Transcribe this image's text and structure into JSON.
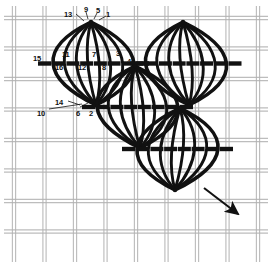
{
  "figure": {
    "type": "needlework-stitch-diagram",
    "ink_color": "#111111",
    "canvas_thread_color": "#b2b2b2",
    "background_color": "#ffffff"
  },
  "stitch_numbers": [
    {
      "label": "13",
      "x": 64,
      "y": 11
    },
    {
      "label": "9",
      "x": 84,
      "y": 6
    },
    {
      "label": "5",
      "x": 96,
      "y": 7
    },
    {
      "label": "1",
      "x": 106,
      "y": 11
    },
    {
      "label": "15",
      "x": 33,
      "y": 55
    },
    {
      "label": "11",
      "x": 62,
      "y": 51
    },
    {
      "label": "7",
      "x": 92,
      "y": 51
    },
    {
      "label": "3",
      "x": 116,
      "y": 50
    },
    {
      "label": "16",
      "x": 55,
      "y": 64
    },
    {
      "label": "12",
      "x": 78,
      "y": 64
    },
    {
      "label": "8",
      "x": 102,
      "y": 64
    },
    {
      "label": "4",
      "x": 127,
      "y": 58
    },
    {
      "label": "14",
      "x": 55,
      "y": 99
    },
    {
      "label": "10",
      "x": 37,
      "y": 110
    },
    {
      "label": "6",
      "x": 76,
      "y": 110
    },
    {
      "label": "2",
      "x": 89,
      "y": 110
    }
  ],
  "leaders": [
    {
      "name": "leader-13",
      "x1": 76,
      "y1": 14,
      "x2": 84,
      "y2": 21
    },
    {
      "name": "leader-9",
      "x1": 86,
      "y1": 12,
      "x2": 88,
      "y2": 19
    },
    {
      "name": "leader-5",
      "x1": 97,
      "y1": 13,
      "x2": 94,
      "y2": 19
    },
    {
      "name": "leader-1",
      "x1": 106,
      "y1": 16,
      "x2": 99,
      "y2": 20
    },
    {
      "name": "leader-14",
      "x1": 68,
      "y1": 101,
      "x2": 80,
      "y2": 105
    },
    {
      "name": "leader-10",
      "x1": 49,
      "y1": 109,
      "x2": 82,
      "y2": 104
    },
    {
      "name": "leader-6",
      "x1": 80,
      "y1": 107,
      "x2": 88,
      "y2": 103
    },
    {
      "name": "leader-2",
      "x1": 92,
      "y1": 107,
      "x2": 96,
      "y2": 103
    }
  ],
  "direction_arrow": {
    "name": "direction-arrow",
    "description": "stitching direction, down and to the right",
    "x1": 204,
    "y1": 188,
    "x2": 238,
    "y2": 214
  },
  "motifs": [
    {
      "name": "leaf-motif-top-left",
      "top_x": 91,
      "top_y": 22,
      "bottom_x": 96,
      "bottom_y": 105,
      "half_width": 49
    },
    {
      "name": "leaf-motif-top-right",
      "top_x": 183,
      "top_y": 22,
      "bottom_x": 189,
      "bottom_y": 105,
      "half_width": 49
    },
    {
      "name": "leaf-motif-middle",
      "top_x": 135,
      "top_y": 66,
      "bottom_x": 140,
      "bottom_y": 148,
      "half_width": 49
    },
    {
      "name": "leaf-motif-bottom-right",
      "top_x": 180,
      "top_y": 108,
      "bottom_x": 175,
      "bottom_y": 190,
      "half_width": 49
    }
  ],
  "canvas_grid": {
    "spacing": 30.5,
    "origin_x": 14,
    "origin_y": 18,
    "columns": 9,
    "rows": 8,
    "thread_pair_gap": 3.2
  }
}
